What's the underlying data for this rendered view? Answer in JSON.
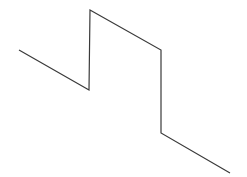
{
  "diagram": {
    "type": "polyline",
    "stroke_color": "#3a3a3a",
    "stroke_width": 1.2,
    "background": "#ffffff",
    "points": [
      [
        19,
        50
      ],
      [
        89,
        90
      ],
      [
        90,
        10
      ],
      [
        161,
        50
      ],
      [
        161,
        133
      ],
      [
        230,
        173
      ]
    ]
  }
}
